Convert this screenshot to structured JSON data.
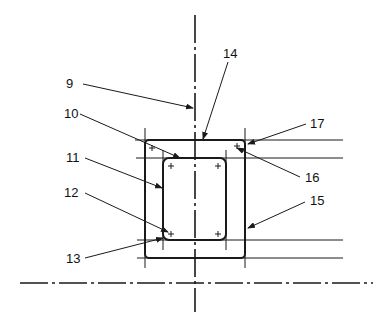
{
  "figure": {
    "type": "technical-drawing",
    "reference_labels": [
      {
        "id": "label-9",
        "text": "9"
      },
      {
        "id": "label-10",
        "text": "10"
      },
      {
        "id": "label-11",
        "text": "11"
      },
      {
        "id": "label-12",
        "text": "12"
      },
      {
        "id": "label-13",
        "text": "13"
      },
      {
        "id": "label-14",
        "text": "14"
      },
      {
        "id": "label-15",
        "text": "15"
      },
      {
        "id": "label-16",
        "text": "16"
      },
      {
        "id": "label-17",
        "text": "17"
      }
    ],
    "colors": {
      "ink": "#1a1a1a",
      "background": "#ffffff"
    }
  }
}
